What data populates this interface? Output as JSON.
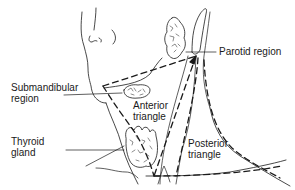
{
  "diagram": {
    "labels": {
      "parotid": "Parotid region",
      "submandibular": [
        "Submandibular",
        "region"
      ],
      "anterior": [
        "Anterior",
        "triangle"
      ],
      "thyroid": [
        "Thyroid",
        "gland"
      ],
      "posterior": [
        "Posterior",
        "triangle"
      ]
    },
    "colors": {
      "ink": "#1a1a1a",
      "background": "#ffffff"
    }
  }
}
